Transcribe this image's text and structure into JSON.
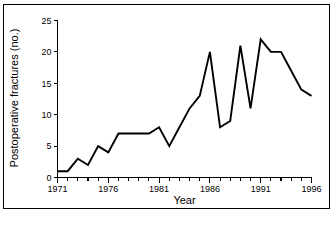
{
  "chart_data": {
    "type": "line",
    "title": "",
    "xlabel": "Year",
    "ylabel": "Postoperative fractures (no.)",
    "xlim": [
      1971,
      1996
    ],
    "ylim": [
      0,
      25
    ],
    "xticks": [
      1971,
      1976,
      1981,
      1986,
      1991,
      1996
    ],
    "xtick_labels": [
      "1971",
      "1976",
      "1981",
      "1986",
      "1991",
      "1996"
    ],
    "yticks": [
      0,
      5,
      10,
      15,
      20,
      25
    ],
    "ytick_labels": [
      "0",
      "5",
      "10",
      "15",
      "20",
      "25"
    ],
    "minor_xticks_every": 1,
    "grid": false,
    "legend": null,
    "line_color": "#000000",
    "x": [
      1971,
      1972,
      1973,
      1974,
      1975,
      1976,
      1977,
      1978,
      1979,
      1980,
      1981,
      1982,
      1983,
      1984,
      1985,
      1986,
      1987,
      1988,
      1989,
      1990,
      1991,
      1992,
      1993,
      1994,
      1995,
      1996
    ],
    "values": [
      1,
      1,
      3,
      2,
      5,
      4,
      7,
      7,
      7,
      7,
      8,
      5,
      8,
      11,
      13,
      20,
      8,
      9,
      21,
      11,
      22,
      20,
      20,
      17,
      14,
      13
    ],
    "series": [
      {
        "name": "Postoperative fractures",
        "values": [
          1,
          1,
          3,
          2,
          5,
          4,
          7,
          7,
          7,
          7,
          8,
          5,
          8,
          11,
          13,
          20,
          8,
          9,
          21,
          11,
          22,
          20,
          20,
          17,
          14,
          13
        ]
      }
    ]
  },
  "axes": {
    "y_title": "Postoperative fractures (no.)",
    "x_title": "Year"
  }
}
